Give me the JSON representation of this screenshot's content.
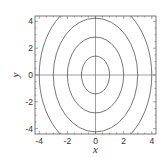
{
  "chart_data": {
    "type": "line",
    "subtype": "contour",
    "title": "",
    "xlabel": "x",
    "ylabel": "y",
    "xlim": [
      -4.3,
      4.3
    ],
    "ylim": [
      -4.4,
      4.4
    ],
    "xticks": [
      -4,
      -2,
      0,
      2,
      4
    ],
    "yticks": [
      -4,
      -2,
      0,
      2,
      4
    ],
    "xtick_labels": [
      "-4",
      "-2",
      "0",
      "2",
      "4"
    ],
    "ytick_labels": [
      "-4",
      "-2",
      "0",
      "2",
      "4"
    ],
    "grid": false,
    "axes_lines_through_origin": true,
    "legend": null,
    "contours": [
      {
        "level": 1,
        "semi_axis_x": 1.0,
        "semi_axis_y": 1.41
      },
      {
        "level": 4,
        "semi_axis_x": 2.0,
        "semi_axis_y": 2.83
      },
      {
        "level": 9,
        "semi_axis_x": 3.0,
        "semi_axis_y": 4.24
      },
      {
        "level": 16,
        "semi_axis_x": 4.0,
        "semi_axis_y": 5.66
      }
    ],
    "equation_hint": "x^2 + y^2/2 = c",
    "line_color": "#555555"
  },
  "labels": {
    "x": "x",
    "y": "y"
  }
}
